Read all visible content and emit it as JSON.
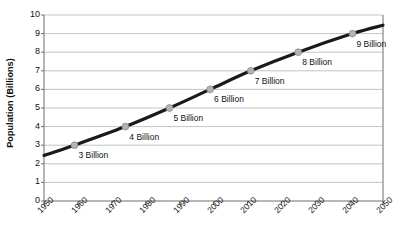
{
  "chart_data": {
    "type": "line",
    "title": "",
    "xlabel": "",
    "ylabel": "Population (Billions)",
    "xlim": [
      1950,
      2050
    ],
    "ylim": [
      0,
      10
    ],
    "grid": true,
    "legend": "none",
    "x_ticks": [
      "1950",
      "1960",
      "1970",
      "1980",
      "1990",
      "2000",
      "2010",
      "2020",
      "2030",
      "2040",
      "2050"
    ],
    "y_ticks": [
      "0",
      "1",
      "2",
      "3",
      "4",
      "5",
      "6",
      "7",
      "8",
      "9",
      "10"
    ],
    "line_start": {
      "x": 1950,
      "y": 2.45
    },
    "line_end": {
      "x": 2050,
      "y": 9.45
    },
    "points": [
      {
        "label": "3 Billion",
        "x": 1959,
        "y": 3
      },
      {
        "label": "4 Billion",
        "x": 1974,
        "y": 4
      },
      {
        "label": "5 Billion",
        "x": 1987,
        "y": 5
      },
      {
        "label": "6 Billion",
        "x": 1999,
        "y": 6
      },
      {
        "label": "7 Billion",
        "x": 2011,
        "y": 7
      },
      {
        "label": "8 Billion",
        "x": 2025,
        "y": 8
      },
      {
        "label": "9 Billion",
        "x": 2041,
        "y": 9
      }
    ],
    "colors": {
      "line": "#1a1a1a",
      "marker_fill": "#b3b3b3",
      "marker_stroke": "#8c8c8c",
      "grid": "#b5b5b5",
      "axis": "#6e6e6e",
      "text": "#111111",
      "background": "#ffffff"
    }
  }
}
